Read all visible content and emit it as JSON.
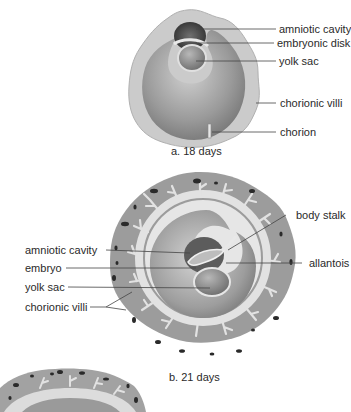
{
  "figure_a": {
    "caption": "a.  18 days",
    "labels": {
      "amniotic_cavity": "amniotic cavity",
      "embryonic_disk": "embryonic disk",
      "yolk_sac": "yolk sac",
      "chorionic_villi": "chorionic villi",
      "chorion": "chorion"
    }
  },
  "figure_b": {
    "caption": "b.  21 days",
    "labels": {
      "body_stalk": "body stalk",
      "amniotic_cavity": "amniotic cavity",
      "allantois": "allantois",
      "embryo": "embryo",
      "yolk_sac": "yolk sac",
      "chorionic_villi": "chorionic villi"
    }
  },
  "colors": {
    "chorion_outer": "#c9c9c9",
    "chorion_b_tissue": "#9c9c9c",
    "villi": "#e2e2e2",
    "cavity": "#8e8e8e",
    "dark_blood": "#2a2a2a",
    "leader_line": "#444444"
  }
}
